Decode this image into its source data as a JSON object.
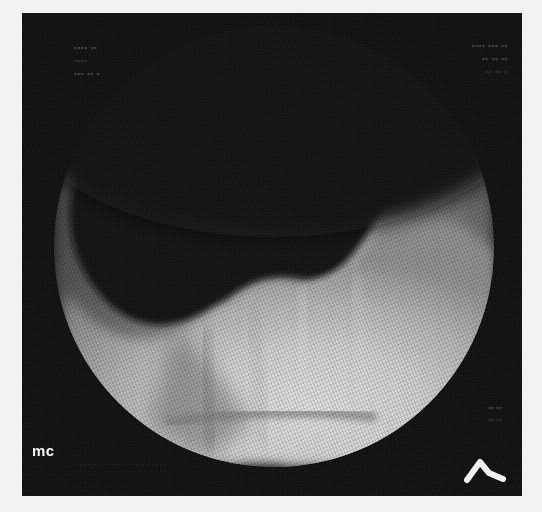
{
  "image": {
    "modality_caption": "mc",
    "description": "Grayscale ultrasound / endoscopic sector image showing a dark anechoic cavity above a bright crescent-shaped tissue wall inside a circular field of view"
  },
  "frame": {
    "outer_background_color": "#f2f2f0",
    "scan_background_color": "#0b0b0b",
    "field_shape": "circle"
  },
  "annotations": {
    "top_left": [
      "•••• ••",
      "••••",
      "••• •• •"
    ],
    "top_right": [
      "•••• ••• ••",
      "•• •• ••",
      "•• •• •"
    ],
    "bottom_right": [
      "•• ••",
      "•• ••"
    ],
    "bottom_strip": "···························",
    "watermark": "mc",
    "probe_marker_icon": "chevron-orientation-marker"
  },
  "colors": {
    "cavity_dark": "#121212",
    "tissue_bright": "#cfcfcf",
    "tissue_mid": "#6e6e6e",
    "tissue_dim": "#4a4a4a",
    "marker_white": "#f4f4f4",
    "overlay_gray": "#6d6d6d"
  }
}
